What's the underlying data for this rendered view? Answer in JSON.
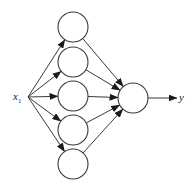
{
  "diagram": {
    "type": "neural-network",
    "input": {
      "label": "x",
      "subscript": "1",
      "x": 20,
      "y": 97
    },
    "hidden_layer": {
      "node_count": 5,
      "cx": 73,
      "r": 15,
      "nodes": [
        {
          "id": "h1",
          "cy": 27
        },
        {
          "id": "h2",
          "cy": 62
        },
        {
          "id": "h3",
          "cy": 96
        },
        {
          "id": "h4",
          "cy": 130
        },
        {
          "id": "h5",
          "cy": 164
        }
      ]
    },
    "output_node": {
      "id": "out",
      "cx": 133,
      "cy": 98,
      "r": 15
    },
    "output": {
      "label": "y",
      "x": 182,
      "y": 98
    },
    "edges": [
      {
        "from": "x1",
        "to": "h1"
      },
      {
        "from": "x1",
        "to": "h2"
      },
      {
        "from": "x1",
        "to": "h3"
      },
      {
        "from": "x1",
        "to": "h4"
      },
      {
        "from": "x1",
        "to": "h5"
      },
      {
        "from": "h1",
        "to": "out"
      },
      {
        "from": "h2",
        "to": "out"
      },
      {
        "from": "h3",
        "to": "out"
      },
      {
        "from": "h4",
        "to": "out"
      },
      {
        "from": "h5",
        "to": "out"
      },
      {
        "from": "out",
        "to": "y"
      }
    ],
    "colors": {
      "stroke": "#3a3a3a",
      "fill": "#ffffff",
      "text": "#222222"
    }
  }
}
